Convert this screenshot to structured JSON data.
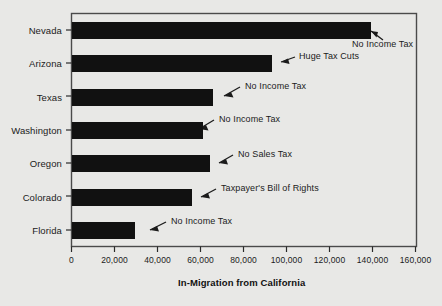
{
  "chart_data": {
    "type": "bar",
    "orientation": "horizontal",
    "title": "",
    "subtitle": "",
    "xlabel": "In-Migration from California",
    "ylabel": "",
    "categories": [
      "Nevada",
      "Arizona",
      "Texas",
      "Washington",
      "Oregon",
      "Colorado",
      "Florida"
    ],
    "values": [
      139500,
      93000,
      65500,
      61000,
      64500,
      56000,
      29500
    ],
    "series": [
      {
        "name": "In-Migration from California",
        "values": [
          139500,
          93000,
          65500,
          61000,
          64500,
          56000,
          29500
        ]
      }
    ],
    "xlim": [
      0,
      160000
    ],
    "xticks": [
      0,
      20000,
      40000,
      60000,
      80000,
      100000,
      120000,
      140000,
      160000
    ],
    "xtick_labels": [
      "0",
      "20,000",
      "40,000",
      "60,000",
      "80,000",
      "100,000",
      "120,000",
      "140,000",
      "160,000"
    ],
    "grid": false,
    "legend": null,
    "bar_color": "#111111",
    "background_color": "#e8e8e6",
    "annotations": [
      {
        "category": "Nevada",
        "text": "No Income Tax"
      },
      {
        "category": "Arizona",
        "text": "Huge Tax Cuts"
      },
      {
        "category": "Texas",
        "text": "No Income Tax"
      },
      {
        "category": "Washington",
        "text": "No Income Tax"
      },
      {
        "category": "Oregon",
        "text": "No Sales Tax"
      },
      {
        "category": "Colorado",
        "text": "Taxpayer's Bill of Rights"
      },
      {
        "category": "Florida",
        "text": "No Income Tax"
      }
    ]
  },
  "axis": {
    "xlabel": "In-Migration from California",
    "tick_labels": [
      "0",
      "20,000",
      "40,000",
      "60,000",
      "80,000",
      "100,000",
      "120,000",
      "140,000",
      "160,000"
    ],
    "category_labels": [
      "Nevada",
      "Arizona",
      "Texas",
      "Washington",
      "Oregon",
      "Colorado",
      "Florida"
    ]
  },
  "annotations": {
    "nevada": "No Income Tax",
    "arizona": "Huge Tax Cuts",
    "texas": "No Income Tax",
    "washington": "No Income Tax",
    "oregon": "No Sales Tax",
    "colorado": "Taxpayer's Bill of Rights",
    "florida": "No Income Tax"
  }
}
